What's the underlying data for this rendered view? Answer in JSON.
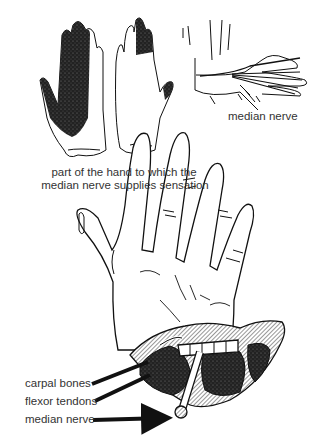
{
  "figure": {
    "panels": {
      "sensation_hands": {
        "caption_line1": "part of the hand to which the",
        "caption_line2": "median nerve supplies sensation"
      },
      "nerve_path_hand": {
        "caption": "median nerve"
      },
      "carpal_tunnel_cross_section": {
        "labels": [
          {
            "text": "carpal bones"
          },
          {
            "text": "flexor tendons"
          },
          {
            "text": "median nerve"
          }
        ]
      }
    },
    "colors": {
      "ink": "#111111",
      "label_text": "#333333",
      "background": "#ffffff",
      "shading_dark": "#2b2b2b",
      "hatch_grey": "#9a9a9a"
    }
  }
}
